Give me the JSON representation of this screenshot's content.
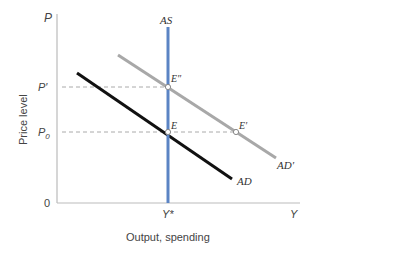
{
  "diagram": {
    "axes": {
      "y_axis_symbol": "P",
      "y_axis_label": "Price level",
      "x_axis_symbol": "Y",
      "x_axis_label": "Output, spending",
      "origin_label": "0",
      "y_ticks": [
        "P'",
        "P0"
      ],
      "x_ticks": [
        "Y*"
      ]
    },
    "curves": {
      "as": {
        "label": "AS",
        "color": "#5b84c4"
      },
      "ad": {
        "label": "AD",
        "color": "#111111"
      },
      "ad_prime": {
        "label": "AD'",
        "color": "#a8a8a8"
      }
    },
    "points": {
      "e": "E",
      "e_prime": "E'",
      "e_double_prime": "E''"
    },
    "labels": {
      "p_prime": "P′",
      "p0_main": "P",
      "p0_sub": "0",
      "y_star": "Y*",
      "e_double_prime_display": "E″",
      "ad_prime_display": "AD′",
      "e_prime_display": "E′"
    }
  }
}
